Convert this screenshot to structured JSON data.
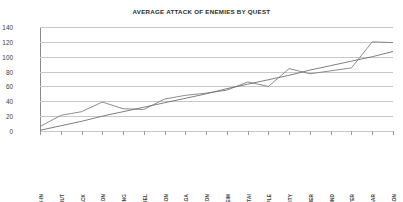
{
  "chart_data": {
    "type": "line",
    "title": "AVERAGE ATTACK OF ENEMIES BY QUEST",
    "xlabel": "",
    "ylabel": "",
    "ylim": [
      0,
      140
    ],
    "ytick_step": 20,
    "yticks": [
      140,
      120,
      100,
      80,
      60,
      40,
      20,
      0
    ],
    "grid": true,
    "legend": "none",
    "categories": [
      "BREACH-IN",
      "BREAKOUT",
      "FLASHBACK",
      "JUNON",
      "CROSSING",
      "TO COREL",
      "COREL PRISON",
      "GONGAGA",
      "COSMO CANYON",
      "NIBELHEIM",
      "WUTAI",
      "ANCIENT TEMPLE",
      "ANCIENT CITY",
      "GREAT GLACIER",
      "WHIRLWIND",
      "UNDERWATER",
      "RETURN TO MIDGAR",
      "LAST DUNGEON"
    ],
    "series": [
      {
        "name": "Average Attack",
        "color": "#808080",
        "values": [
          6,
          21,
          26,
          39,
          30,
          29,
          43,
          48,
          51,
          55,
          66,
          60,
          84,
          77,
          81,
          85,
          120,
          119
        ]
      },
      {
        "name": "Linear Trendline",
        "color": "#707070",
        "style": "trend",
        "values": [
          1,
          7,
          13,
          20,
          26,
          32,
          38,
          44,
          50,
          57,
          63,
          69,
          75,
          82,
          88,
          94,
          100,
          107
        ]
      }
    ]
  },
  "colors": {
    "gridline": "#c8c8c8",
    "axis": "#8a8a8a",
    "text": "#3d3d3d",
    "background": "#ffffff"
  }
}
